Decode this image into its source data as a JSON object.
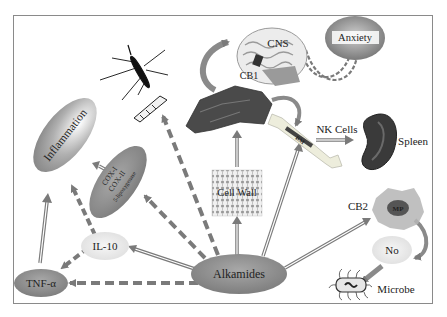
{
  "diagram": {
    "title": "",
    "colors": {
      "node_fill": "#8c8c8c",
      "node_light": "#e2e2e2",
      "arrow": "#7a7a7a",
      "border": "#8a8a8a",
      "text": "#222222"
    },
    "nodes": {
      "alkamides": "Alkamides",
      "tnf": "TNF-α",
      "il10": "IL-10",
      "inflammation": "Inflammation",
      "cox1": "COX-I",
      "cox2": "COX-II",
      "lipox": "5-lipoxygenase",
      "cell_wall": "Cell Wall",
      "cns": "CNS",
      "cb1": "CB1",
      "anxiety": "Anxiety",
      "bm": "BM",
      "nk_cells": "NK Cells",
      "spleen": "Spleen",
      "cb2": "CB2",
      "mp": "MP",
      "no": "No",
      "microbe": "Microbe"
    },
    "edges": [
      {
        "from": "Alkamides",
        "to": "TNF-α",
        "style": "dashed"
      },
      {
        "from": "Alkamides",
        "to": "IL-10",
        "style": "double"
      },
      {
        "from": "Alkamides",
        "to": "COX-I/COX-II/5-lipoxygenase",
        "style": "dashed"
      },
      {
        "from": "Alkamides",
        "to": "Mosquito larva",
        "style": "dashed"
      },
      {
        "from": "Alkamides",
        "to": "Cell Wall",
        "style": "double"
      },
      {
        "from": "Alkamides",
        "to": "BM",
        "style": "double"
      },
      {
        "from": "Alkamides",
        "to": "CB2",
        "style": "double"
      },
      {
        "from": "IL-10",
        "to": "TNF-α",
        "style": "dashed"
      },
      {
        "from": "IL-10",
        "to": "Inflammation",
        "style": "dashed"
      },
      {
        "from": "TNF-α",
        "to": "Inflammation",
        "style": "double"
      },
      {
        "from": "COX-I/COX-II/5-lipoxygenase",
        "to": "Inflammation",
        "style": "double"
      },
      {
        "from": "Cell Wall",
        "to": "Tissue",
        "style": "double"
      },
      {
        "from": "Tissue",
        "to": "CNS",
        "style": "curved"
      },
      {
        "from": "Tissue",
        "to": "BM",
        "style": "curved"
      },
      {
        "from": "CNS",
        "to": "Anxiety",
        "style": "dashed-curved"
      },
      {
        "from": "BM",
        "to": "Spleen",
        "style": "double",
        "label": "NK Cells"
      },
      {
        "from": "MP",
        "to": "No",
        "style": "curved"
      },
      {
        "from": "No",
        "to": "Microbe",
        "style": "solid"
      }
    ]
  }
}
